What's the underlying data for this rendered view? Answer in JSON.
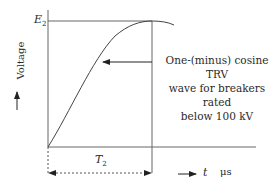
{
  "diagram": {
    "y_axis_label": "Voltage",
    "x_axis_var": "t",
    "x_axis_unit": "μs",
    "peak_label": "E",
    "peak_label_sub": "2",
    "time_label": "T",
    "time_label_sub": "2",
    "annotation_lines": [
      "One-(minus) cosine TRV",
      "wave for breakers rated",
      "below 100 kV"
    ],
    "curve_type": "one-minus-cosine",
    "line_color": "#555555"
  }
}
